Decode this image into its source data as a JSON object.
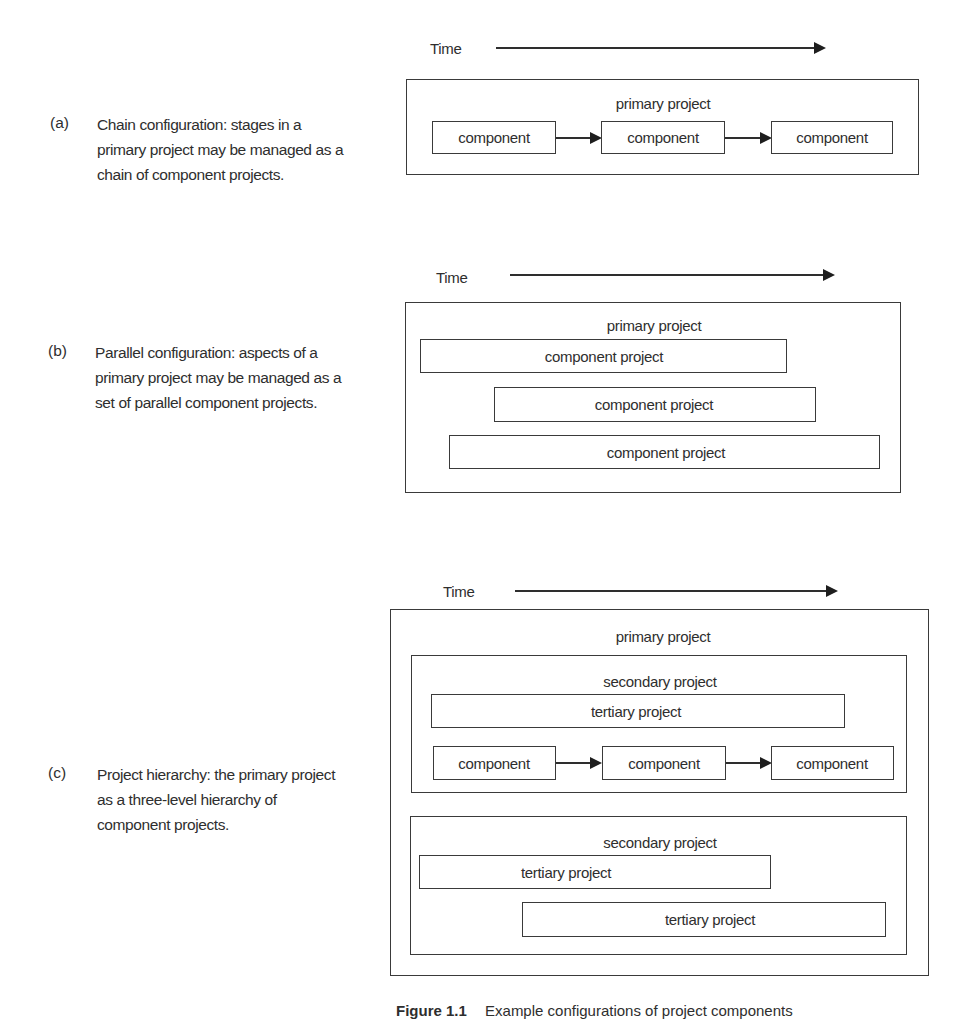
{
  "panels": {
    "a": {
      "tag": "(a)",
      "description": [
        "Chain configuration: stages in a",
        "primary project may be managed as a",
        "chain of component projects."
      ],
      "time_label": "Time",
      "primary_label": "primary project",
      "components": [
        "component",
        "component",
        "component"
      ]
    },
    "b": {
      "tag": "(b)",
      "description": [
        "Parallel configuration: aspects of a",
        "primary project may be managed as a",
        "set of parallel component projects."
      ],
      "time_label": "Time",
      "primary_label": "primary project",
      "components": [
        "component project",
        "component project",
        "component project"
      ]
    },
    "c": {
      "tag": "(c)",
      "description": [
        "Project hierarchy: the primary project",
        "as a three-level hierarchy of",
        "component projects."
      ],
      "time_label": "Time",
      "primary_label": "primary project",
      "secondary": [
        {
          "label": "secondary project",
          "tertiary": [
            "tertiary project"
          ],
          "components": [
            "component",
            "component",
            "component"
          ]
        },
        {
          "label": "secondary project",
          "tertiary": [
            "tertiary project",
            "tertiary project"
          ]
        }
      ]
    }
  },
  "caption": {
    "figure": "Figure 1.1",
    "text": "Example configurations of project components"
  },
  "colors": {
    "line": "#3a3a3a",
    "text": "#2e2e2e",
    "background": "#ffffff"
  }
}
